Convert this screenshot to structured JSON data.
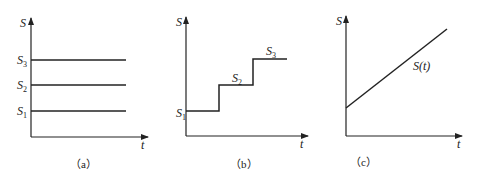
{
  "panels": [
    {
      "id": "a",
      "caption": "（a）",
      "y_label": "S",
      "x_label": "t",
      "levels": [
        {
          "main": "S",
          "sub": "3"
        },
        {
          "main": "S",
          "sub": "2"
        },
        {
          "main": "S",
          "sub": "1"
        }
      ]
    },
    {
      "id": "b",
      "caption": "（b）",
      "y_label": "S",
      "x_label": "t",
      "steps": [
        {
          "main": "S",
          "sub": "1"
        },
        {
          "main": "S",
          "sub": "2"
        },
        {
          "main": "S",
          "sub": "3"
        }
      ]
    },
    {
      "id": "c",
      "caption": "（c）",
      "y_label": "S",
      "x_label": "t",
      "curve_label": "S(t)"
    }
  ],
  "colors": {
    "line": "#222222",
    "background": "#ffffff"
  }
}
